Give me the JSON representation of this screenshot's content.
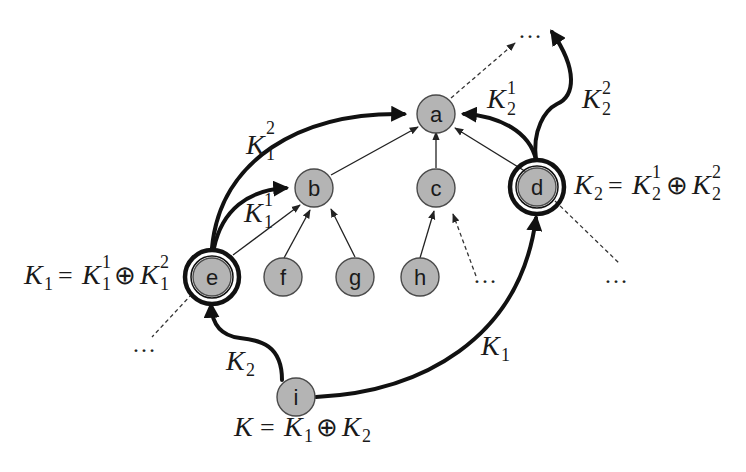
{
  "diagram": {
    "nodes": [
      {
        "id": "a",
        "label": "a"
      },
      {
        "id": "b",
        "label": "b"
      },
      {
        "id": "c",
        "label": "c"
      },
      {
        "id": "d",
        "label": "d",
        "highlighted": true
      },
      {
        "id": "e",
        "label": "e",
        "highlighted": true
      },
      {
        "id": "f",
        "label": "f"
      },
      {
        "id": "g",
        "label": "g"
      },
      {
        "id": "h",
        "label": "h"
      },
      {
        "id": "i",
        "label": "i"
      }
    ],
    "edges": [
      {
        "from": "b",
        "to": "a",
        "style": "thin"
      },
      {
        "from": "c",
        "to": "a",
        "style": "thin"
      },
      {
        "from": "d",
        "to": "a",
        "style": "thin"
      },
      {
        "from": "e",
        "to": "b",
        "style": "thin"
      },
      {
        "from": "f",
        "to": "b",
        "style": "thin"
      },
      {
        "from": "g",
        "to": "b",
        "style": "thin"
      },
      {
        "from": "h",
        "to": "c",
        "style": "thin"
      },
      {
        "from": "a",
        "to": "…",
        "style": "dashed"
      },
      {
        "from": "…",
        "to": "c",
        "style": "dashed"
      },
      {
        "from": "d",
        "to": "…",
        "style": "dashed"
      },
      {
        "from": "e",
        "to": "…",
        "style": "dashed"
      },
      {
        "from": "e",
        "to": "a",
        "style": "thick",
        "label": "K_1^2"
      },
      {
        "from": "e",
        "to": "b",
        "style": "thick",
        "label": "K_1^1"
      },
      {
        "from": "d",
        "to": "a",
        "style": "thick",
        "label": "K_2^1"
      },
      {
        "from": "d",
        "to": "…",
        "style": "thick",
        "label": "K_2^2"
      },
      {
        "from": "i",
        "to": "e",
        "style": "thick",
        "label": "K_2"
      },
      {
        "from": "i",
        "to": "d",
        "style": "thick",
        "label": "K_1"
      }
    ],
    "ellipsis": "…",
    "labels": {
      "K": "K",
      "sub1": "1",
      "sub2": "2",
      "sup1": "1",
      "sup2": "2",
      "eq": "=",
      "oplus": "⊕"
    },
    "equations": {
      "e": "K_1 = K_1^1 ⊕ K_1^2",
      "d": "K_2 = K_2^1 ⊕ K_2^2",
      "i": "K = K_1 ⊕ K_2"
    }
  }
}
